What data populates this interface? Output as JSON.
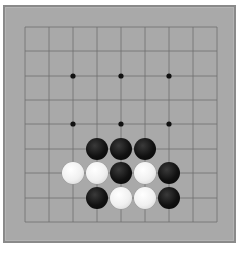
{
  "game": {
    "type": "go",
    "board_size": 9,
    "colors": {
      "board": "#a9a9a9",
      "border": "#8a8a8a",
      "line": "#6e6e6e",
      "black": "#111111",
      "white": "#f2f2f2"
    },
    "grid": {
      "x": [
        25,
        49,
        73,
        97,
        121,
        145,
        169,
        193,
        217
      ],
      "y": [
        27,
        51,
        76,
        100,
        124,
        149,
        173,
        198,
        222
      ]
    },
    "star_points": [
      [
        2,
        2
      ],
      [
        4,
        2
      ],
      [
        6,
        2
      ],
      [
        2,
        4
      ],
      [
        4,
        4
      ],
      [
        6,
        4
      ]
    ],
    "stones": [
      {
        "col": 3,
        "row": 5,
        "color": "black"
      },
      {
        "col": 4,
        "row": 5,
        "color": "black"
      },
      {
        "col": 5,
        "row": 5,
        "color": "black"
      },
      {
        "col": 2,
        "row": 6,
        "color": "white"
      },
      {
        "col": 3,
        "row": 6,
        "color": "white"
      },
      {
        "col": 4,
        "row": 6,
        "color": "black"
      },
      {
        "col": 5,
        "row": 6,
        "color": "white"
      },
      {
        "col": 6,
        "row": 6,
        "color": "black"
      },
      {
        "col": 3,
        "row": 7,
        "color": "black"
      },
      {
        "col": 4,
        "row": 7,
        "color": "white"
      },
      {
        "col": 5,
        "row": 7,
        "color": "white"
      },
      {
        "col": 6,
        "row": 7,
        "color": "black"
      }
    ]
  }
}
